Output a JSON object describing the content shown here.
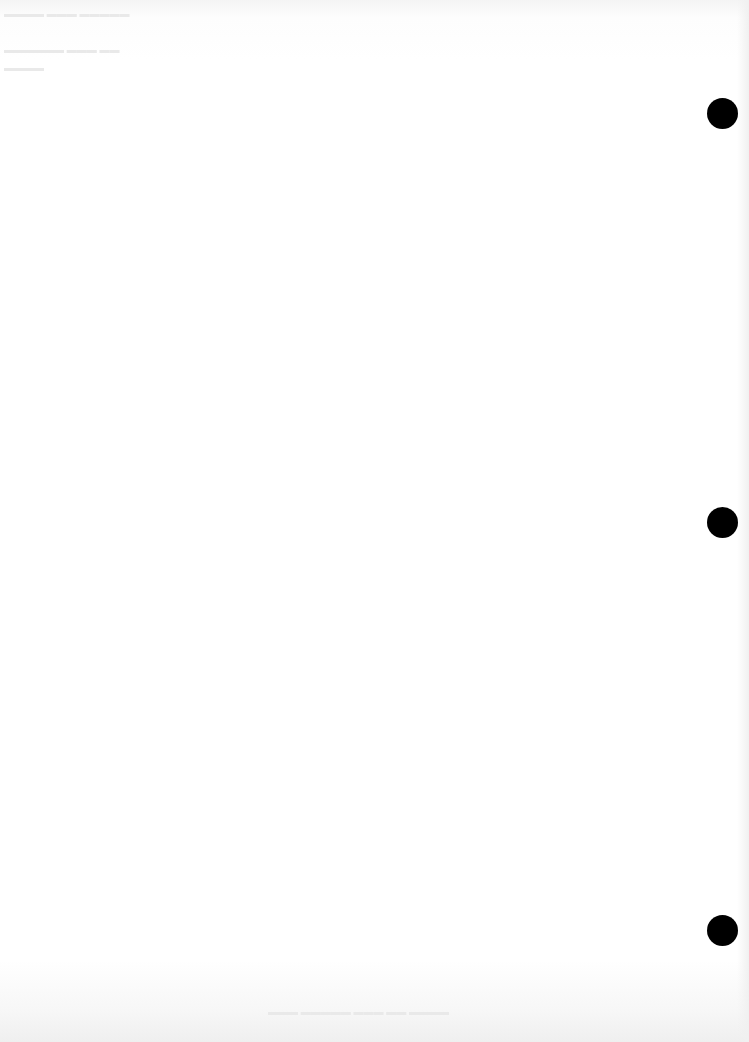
{
  "page": {
    "type": "blank-scanned-sheet",
    "background": "#ffffff",
    "punch_holes": [
      {
        "cx": 723,
        "cy": 113,
        "color": "#000000"
      },
      {
        "cx": 723,
        "cy": 522,
        "color": "#000000"
      },
      {
        "cx": 723,
        "cy": 930,
        "color": "#000000"
      }
    ],
    "text_content": ""
  }
}
